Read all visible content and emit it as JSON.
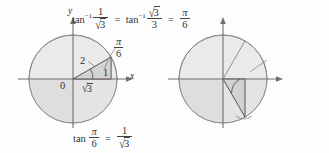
{
  "figure": {
    "background": "#fdfdfd",
    "ink": "#333333",
    "circle_fill": "#e9e9e9",
    "circle_fill_dark": "#dcdcdc",
    "circle_stroke": "#8c8c8c",
    "axis_color": "#6f6f6f",
    "triangle_fill": "#cfcfcf"
  },
  "panels": [
    {
      "id": "left",
      "name": "arctan-one-over-root-three",
      "top_equation": "tan⁻¹ 1/√3 = tan⁻¹ √3/3 = π/6",
      "bottom_equation": "tan π/6 = 1/√3",
      "axis_x_label": "x",
      "axis_y_label": "y",
      "origin_label": "0",
      "angle_label": "π/6",
      "angle_value_rad": 0.5235987756,
      "angle_value_deg": 30,
      "triangle": {
        "hypotenuse_label": "2",
        "opposite_label": "1",
        "adjacent_label": "√3",
        "opposite_value": 1,
        "adjacent_value": 1.7320508,
        "hypotenuse_value": 2
      },
      "tangent_value": "1/√3"
    },
    {
      "id": "right",
      "name": "arctan-negative-root-three",
      "top_equation": "tan⁻¹(−√3) = −π/3",
      "bottom_equation": "tan(−π/3) = −√3",
      "axis_x_label": "x",
      "axis_y_label": "y",
      "origin_label": "0",
      "angle_label": "−π/3",
      "angle_value_rad": -1.0471975512,
      "angle_value_deg": -60,
      "triangle": {
        "hypotenuse_label": "2",
        "opposite_label": "1",
        "adjacent_label": "−√3",
        "opposite_value": 1,
        "adjacent_value": -1.7320508,
        "hypotenuse_value": 2
      },
      "tangent_value": "−√3"
    }
  ],
  "glyphs": {
    "tan": "tan",
    "inverse_exponent": "−1",
    "pi": "π",
    "minus": "−",
    "equals": "=",
    "three": "3",
    "six": "6",
    "one": "1",
    "two": "2",
    "zero": "0",
    "x": "x",
    "y": "y",
    "radical": "√"
  }
}
